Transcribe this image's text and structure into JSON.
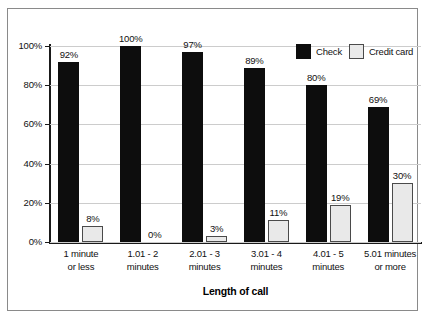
{
  "chart_data": {
    "type": "bar",
    "title": "",
    "xlabel": "Length of call",
    "ylabel": "",
    "categories": [
      "1 minute\nor less",
      "1.01 - 2\nminutes",
      "2.01 - 3\nminutes",
      "3.01 - 4\nminutes",
      "4.01 - 5\nminutes",
      "5.01 minutes\nor more"
    ],
    "series": [
      {
        "name": "Check",
        "color": "#0d0d0d",
        "values": [
          92,
          100,
          97,
          89,
          80,
          69
        ],
        "labels": [
          "92%",
          "100%",
          "97%",
          "89%",
          "80%",
          "69%"
        ]
      },
      {
        "name": "Credit card",
        "color": "#e9e9e9",
        "values": [
          8,
          0,
          3,
          11,
          19,
          30
        ],
        "labels": [
          "8%",
          "0%",
          "3%",
          "11%",
          "19%",
          "30%"
        ]
      }
    ],
    "ylim": [
      0,
      100
    ],
    "yticks": [
      0,
      20,
      40,
      60,
      80,
      100
    ],
    "ytick_labels": [
      "0%",
      "20%",
      "40%",
      "60%",
      "80%",
      "100%"
    ],
    "grid": true,
    "legend_position": "top-right"
  },
  "legend": {
    "items": [
      {
        "label": "Check"
      },
      {
        "label": "Credit card"
      }
    ]
  },
  "axis": {
    "x_title": "Length of call"
  }
}
